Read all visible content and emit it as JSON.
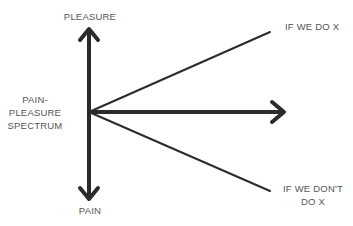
{
  "diagram": {
    "type": "pain-pleasure spectrum",
    "labels": {
      "top": "PLEASURE",
      "bottom": "PAIN",
      "axis": "PAIN-\nPLEASURE\nSPECTRUM",
      "axis_lines": [
        "PAIN-",
        "PLEASURE",
        "SPECTRUM"
      ],
      "upper_branch": "IF WE DO X",
      "lower_branch_lines": [
        "IF WE DON'T",
        "DO X"
      ]
    },
    "colors": {
      "stroke": "#2b2b2b",
      "text": "#555555",
      "background": "#ffffff"
    },
    "geometry": {
      "origin": [
        89,
        112
      ],
      "vertical_top": [
        89,
        28
      ],
      "vertical_bottom": [
        89,
        200
      ],
      "horizontal_end": [
        285,
        112
      ],
      "upper_end": [
        270,
        32
      ],
      "lower_end": [
        270,
        191
      ]
    }
  }
}
